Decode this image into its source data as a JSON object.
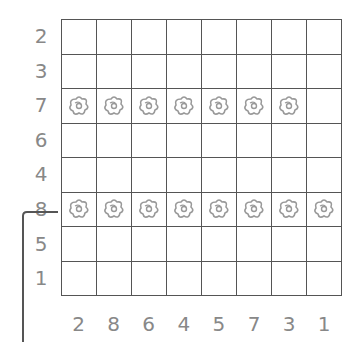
{
  "puzzle": {
    "rows": 8,
    "cols": 8,
    "row_labels": [
      "2",
      "3",
      "7",
      "6",
      "4",
      "8",
      "5",
      "1"
    ],
    "col_labels": [
      "2",
      "8",
      "6",
      "4",
      "5",
      "7",
      "3",
      "1"
    ],
    "cell_icon": "flower-icon",
    "filled": [
      [
        0,
        0,
        0,
        0,
        0,
        0,
        0,
        0
      ],
      [
        0,
        0,
        0,
        0,
        0,
        0,
        0,
        0
      ],
      [
        1,
        1,
        1,
        1,
        1,
        1,
        1,
        0
      ],
      [
        0,
        0,
        0,
        0,
        0,
        0,
        0,
        0
      ],
      [
        0,
        0,
        0,
        0,
        0,
        0,
        0,
        0
      ],
      [
        1,
        1,
        1,
        1,
        1,
        1,
        1,
        1
      ],
      [
        0,
        0,
        0,
        0,
        0,
        0,
        0,
        0
      ],
      [
        0,
        0,
        0,
        0,
        0,
        0,
        0,
        0
      ]
    ],
    "highlighted_row_label": "8",
    "colors": {
      "grid_line": "#555555",
      "label": "#888888",
      "icon": "#999999",
      "bracket": "#555555"
    }
  }
}
